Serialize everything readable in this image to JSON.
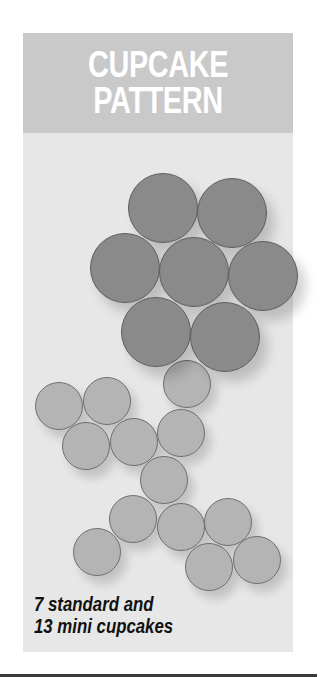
{
  "header": {
    "title_line1": "CUPCAKE",
    "title_line2": "PATTERN"
  },
  "caption": {
    "line1": "7 standard and",
    "line2": "13 mini cupcakes"
  },
  "colors": {
    "panel_bg": "#e7e7e7",
    "header_bg": "#c9c9c9",
    "title_text": "#ffffff",
    "standard_cupcake": "#8a8a8a",
    "mini_cupcake": "#b4b4b4",
    "caption_text": "#111111"
  },
  "pattern": {
    "standard_count": 7,
    "mini_count": 13,
    "standard_cupcakes": [
      {
        "cx": 163,
        "cy": 208,
        "r": 35
      },
      {
        "cx": 232,
        "cy": 213,
        "r": 35
      },
      {
        "cx": 125,
        "cy": 268,
        "r": 35
      },
      {
        "cx": 194,
        "cy": 272,
        "r": 35
      },
      {
        "cx": 263,
        "cy": 276,
        "r": 35
      },
      {
        "cx": 156,
        "cy": 332,
        "r": 35
      },
      {
        "cx": 225,
        "cy": 337,
        "r": 35
      }
    ],
    "mini_cupcakes": [
      {
        "cx": 59,
        "cy": 406,
        "r": 24
      },
      {
        "cx": 107,
        "cy": 401,
        "r": 24
      },
      {
        "cx": 187,
        "cy": 384,
        "r": 24
      },
      {
        "cx": 86,
        "cy": 446,
        "r": 24
      },
      {
        "cx": 134,
        "cy": 442,
        "r": 24
      },
      {
        "cx": 181,
        "cy": 433,
        "r": 24
      },
      {
        "cx": 164,
        "cy": 480,
        "r": 24
      },
      {
        "cx": 133,
        "cy": 519,
        "r": 24
      },
      {
        "cx": 181,
        "cy": 527,
        "r": 24
      },
      {
        "cx": 228,
        "cy": 522,
        "r": 24
      },
      {
        "cx": 97,
        "cy": 552,
        "r": 24
      },
      {
        "cx": 209,
        "cy": 567,
        "r": 24
      },
      {
        "cx": 257,
        "cy": 560,
        "r": 24
      }
    ]
  }
}
